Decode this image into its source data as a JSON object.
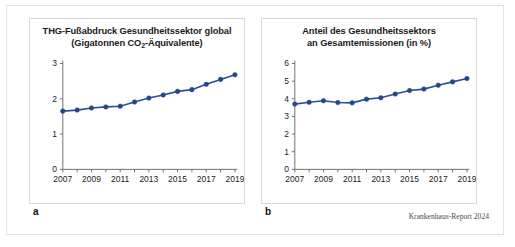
{
  "figure": {
    "source_note": "Krankenhaus-Report 2024",
    "accent_color": "#24468a",
    "line_color": "#2c4f92",
    "axis_color": "#6f6f6f"
  },
  "panels": [
    {
      "letter": "a",
      "title_line1": "THG-Fußabdruck Gesundheitssektor global",
      "title_line2_pre": "(Gigatonnen CO",
      "title_line2_sub": "2",
      "title_line2_post": "-Äquivalente)"
    },
    {
      "letter": "b",
      "title_line1": "Anteil des Gesundheitssektors",
      "title_line2": "an Gesamtemissionen (in %)"
    }
  ],
  "chart_data": [
    {
      "type": "line",
      "panel": "a",
      "title": "THG-Fußabdruck Gesundheitssektor global (Gigatonnen CO2-Äquivalente)",
      "xlabel": "",
      "ylabel": "",
      "x": [
        2007,
        2008,
        2009,
        2010,
        2011,
        2012,
        2013,
        2014,
        2015,
        2016,
        2017,
        2018,
        2019
      ],
      "values": [
        1.65,
        1.68,
        1.74,
        1.77,
        1.79,
        1.91,
        2.02,
        2.11,
        2.21,
        2.26,
        2.41,
        2.55,
        2.68
      ],
      "xlim": [
        2007,
        2019
      ],
      "ylim": [
        0,
        3
      ],
      "yticks": [
        0,
        1,
        2,
        3
      ],
      "ytick_labels": [
        "0",
        "1",
        "2",
        "3"
      ],
      "xticks": [
        2007,
        2008,
        2009,
        2010,
        2011,
        2012,
        2013,
        2014,
        2015,
        2016,
        2017,
        2018,
        2019
      ],
      "xtick_labels": [
        "2007",
        "",
        "2009",
        "",
        "2011",
        "",
        "2013",
        "",
        "2015",
        "",
        "2017",
        "",
        "2019"
      ],
      "grid": false,
      "legend": "none",
      "marker": "circle"
    },
    {
      "type": "line",
      "panel": "b",
      "title": "Anteil des Gesundheitssektors an Gesamtemissionen (in %)",
      "xlabel": "",
      "ylabel": "",
      "x": [
        2007,
        2008,
        2009,
        2010,
        2011,
        2012,
        2013,
        2014,
        2015,
        2016,
        2017,
        2018,
        2019
      ],
      "values": [
        3.7,
        3.8,
        3.89,
        3.79,
        3.77,
        3.98,
        4.06,
        4.27,
        4.47,
        4.55,
        4.77,
        4.96,
        5.15
      ],
      "xlim": [
        2007,
        2019
      ],
      "ylim": [
        0,
        6
      ],
      "yticks": [
        0,
        1,
        2,
        3,
        4,
        5,
        6
      ],
      "ytick_labels": [
        "0",
        "1",
        "2",
        "3",
        "4",
        "5",
        "6"
      ],
      "xticks": [
        2007,
        2008,
        2009,
        2010,
        2011,
        2012,
        2013,
        2014,
        2015,
        2016,
        2017,
        2018,
        2019
      ],
      "xtick_labels": [
        "2007",
        "",
        "2009",
        "",
        "2011",
        "",
        "2013",
        "",
        "2015",
        "",
        "2017",
        "",
        "2019"
      ],
      "grid": false,
      "legend": "none",
      "marker": "circle"
    }
  ]
}
